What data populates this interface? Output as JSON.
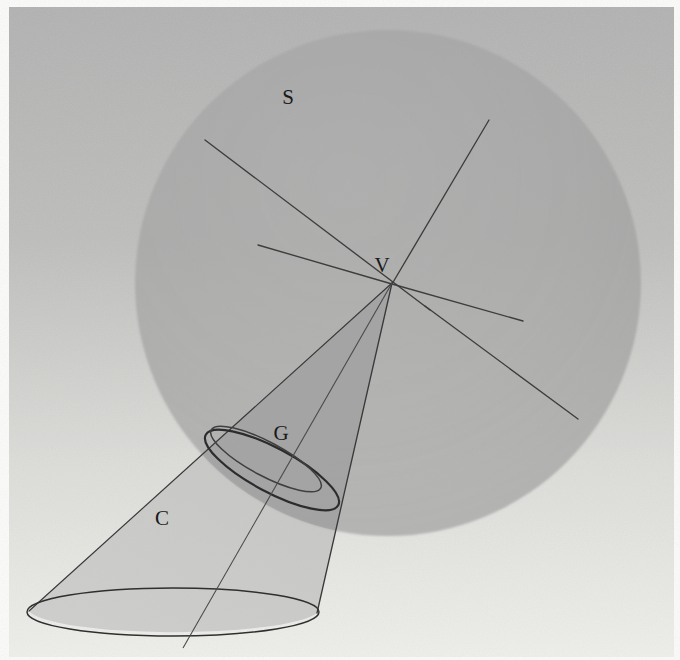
{
  "figure": {
    "canvas": {
      "width": 680,
      "height": 660
    },
    "background": {
      "paper_color": "#f4f4f2",
      "top_color": "#b4b4b4",
      "bottom_color": "#ededea",
      "margin_color": "#fbfbfa"
    },
    "labels": [
      {
        "id": "sphere-label",
        "text": "S",
        "x": 288,
        "y": 104
      },
      {
        "id": "vertex-label",
        "text": "V",
        "x": 382,
        "y": 272
      },
      {
        "id": "circle-label",
        "text": "G",
        "x": 281,
        "y": 440
      },
      {
        "id": "cone-label",
        "text": "C",
        "x": 162,
        "y": 525
      }
    ],
    "sphere": {
      "name": "S",
      "center_x": 388,
      "center_y": 283,
      "radius": 253,
      "fill_color": "#a6a6a6",
      "opacity": 0.62
    },
    "vertex": {
      "name": "V",
      "x": 392,
      "y": 283
    },
    "cone": {
      "name": "C",
      "apex_x": 392,
      "apex_y": 283,
      "base_center_x": 173,
      "base_center_y": 612,
      "base_rx": 146,
      "base_ry": 24,
      "fill_color": "#b9b9b9",
      "opacity": 0.55,
      "outline_color": "#3a3a3a"
    },
    "contact_circle": {
      "name": "G",
      "center_x": 272,
      "center_y": 470,
      "rx": 75,
      "ry": 22,
      "rotation_deg": 28,
      "outline_color": "#2c2c2c"
    },
    "contact_circle_inner": {
      "center_x": 268,
      "center_y": 460,
      "rx": 62,
      "ry": 17,
      "rotation_deg": 28,
      "outline_color": "#3d3d3d"
    },
    "great_circle_lines": [
      {
        "id": "line-upper-left",
        "x1": 205,
        "y1": 140,
        "x2": 430,
        "y2": 310,
        "color": "#3d3d3d"
      },
      {
        "id": "line-lower-right",
        "x1": 430,
        "y1": 310,
        "x2": 578,
        "y2": 419,
        "color": "#3d3d3d"
      },
      {
        "id": "line-upper-right",
        "x1": 489,
        "y1": 120,
        "x2": 392,
        "y2": 283,
        "color": "#3d3d3d"
      },
      {
        "id": "line-left-short",
        "x1": 258,
        "y1": 245,
        "x2": 392,
        "y2": 283,
        "color": "#3d3d3d"
      },
      {
        "id": "line-right-short",
        "x1": 392,
        "y1": 283,
        "x2": 523,
        "y2": 321,
        "color": "#3d3d3d"
      }
    ],
    "axis_line": {
      "id": "cone-axis",
      "x1": 392,
      "y1": 283,
      "x2": 183,
      "y2": 648,
      "color": "#4a4a4a"
    },
    "elements": [
      {
        "key": "S",
        "meaning": "sphere"
      },
      {
        "key": "V",
        "meaning": "vertex of cone"
      },
      {
        "key": "G",
        "meaning": "circle of tangency"
      },
      {
        "key": "C",
        "meaning": "cone"
      }
    ]
  }
}
